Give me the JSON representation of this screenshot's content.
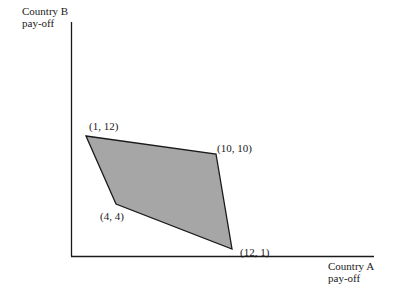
{
  "axes": {
    "y_label_line1": "Country B",
    "y_label_line2": "pay-off",
    "x_label_line1": "Country A",
    "x_label_line2": "pay-off"
  },
  "points": [
    {
      "label": "(1, 12)",
      "x": 1,
      "y": 12
    },
    {
      "label": "(10, 10)",
      "x": 10,
      "y": 10
    },
    {
      "label": "(12, 1)",
      "x": 12,
      "y": 1
    },
    {
      "label": "(4, 4)",
      "x": 4,
      "y": 4
    }
  ],
  "colors": {
    "fill": "#a6a6a6",
    "stroke": "#1a1a1a",
    "background": "#ffffff"
  }
}
